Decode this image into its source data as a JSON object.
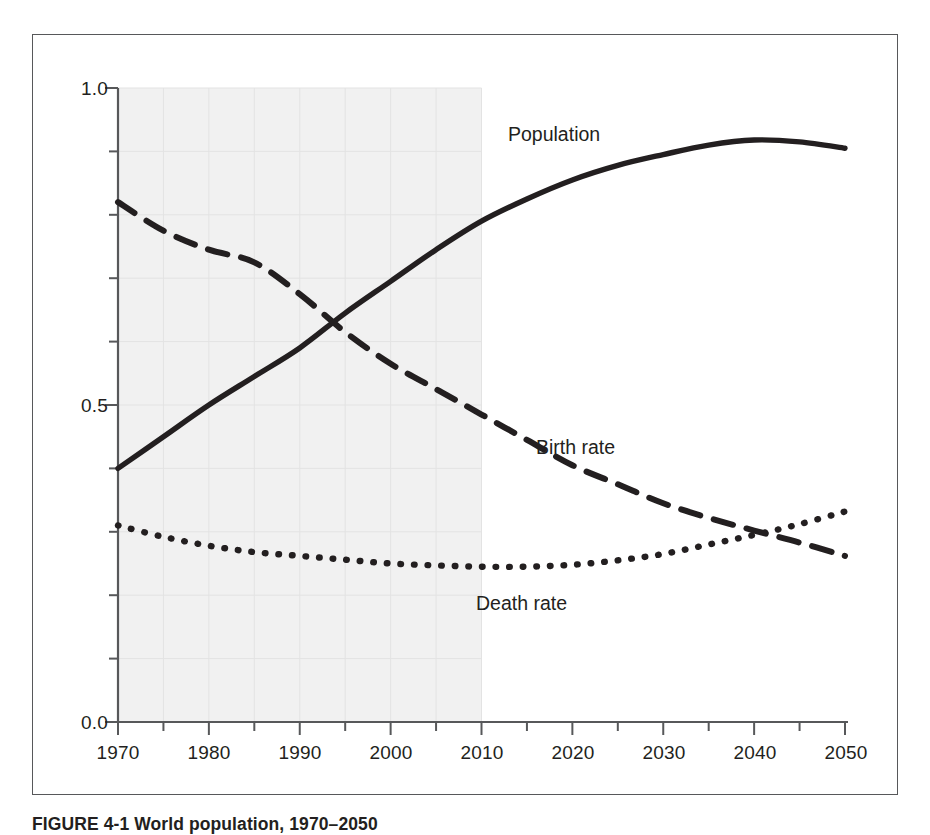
{
  "figure": {
    "caption": "FIGURE 4-1 World population, 1970–2050"
  },
  "chart_data": {
    "type": "line",
    "title": "",
    "xlabel": "",
    "ylabel": "",
    "xlim": [
      1970,
      2050
    ],
    "ylim": [
      0.0,
      1.0
    ],
    "grid": true,
    "grid_note": "faint gridlines visible only inside shaded historical band",
    "legend_position": "inline-labels",
    "x_tick_labels": [
      "1970",
      "1980",
      "1990",
      "2000",
      "2010",
      "2020",
      "2030",
      "2040",
      "2050"
    ],
    "x_ticks": [
      1970,
      1980,
      1990,
      2000,
      2010,
      2020,
      2030,
      2040,
      2050
    ],
    "x_minor_tick_interval": 5,
    "y_tick_labels": [
      "1.0",
      "0.5",
      "0.0"
    ],
    "y_ticks": [
      1.0,
      0.5,
      0.0
    ],
    "y_minor_tick_interval": 0.1,
    "shaded_region": {
      "label": "historical",
      "x_start": 1970,
      "x_end": 2010,
      "color": "#f1f1f1"
    },
    "x": [
      1970,
      1975,
      1980,
      1985,
      1990,
      1995,
      2000,
      2005,
      2010,
      2015,
      2020,
      2025,
      2030,
      2035,
      2040,
      2045,
      2050
    ],
    "series": [
      {
        "name": "Population",
        "style": "solid",
        "color": "#231f20",
        "values": [
          0.4,
          0.45,
          0.5,
          0.545,
          0.59,
          0.645,
          0.695,
          0.745,
          0.79,
          0.825,
          0.855,
          0.878,
          0.895,
          0.91,
          0.918,
          0.915,
          0.905
        ]
      },
      {
        "name": "Birth rate",
        "style": "dashed",
        "color": "#231f20",
        "values": [
          0.82,
          0.775,
          0.745,
          0.725,
          0.675,
          0.615,
          0.565,
          0.525,
          0.485,
          0.445,
          0.405,
          0.375,
          0.345,
          0.322,
          0.302,
          0.283,
          0.262
        ]
      },
      {
        "name": "Death rate",
        "style": "dotted",
        "color": "#231f20",
        "values": [
          0.31,
          0.292,
          0.278,
          0.268,
          0.262,
          0.256,
          0.25,
          0.247,
          0.245,
          0.245,
          0.248,
          0.255,
          0.265,
          0.28,
          0.295,
          0.312,
          0.332
        ]
      }
    ],
    "annotations": [
      {
        "text": "Population",
        "x": 2013,
        "y": 0.955
      },
      {
        "text": "Birth rate",
        "x": 2022,
        "y": 0.455
      },
      {
        "text": "Death rate",
        "x": 2009,
        "y": 0.195
      }
    ]
  }
}
